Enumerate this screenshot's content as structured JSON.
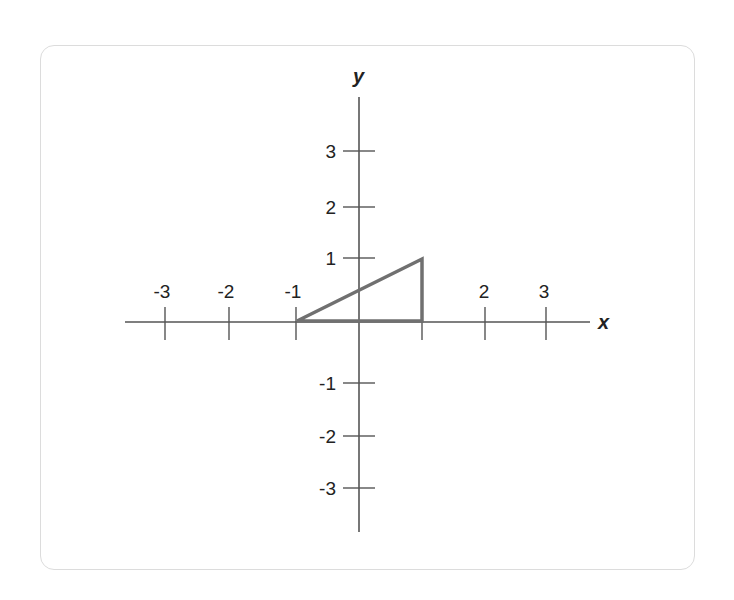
{
  "diagram": {
    "type": "coordinate-plane",
    "axes": {
      "x_label": "x",
      "y_label": "y",
      "x_ticks": [
        "-3",
        "-2",
        "-1",
        "2",
        "3"
      ],
      "y_ticks": [
        "3",
        "2",
        "1",
        "-1",
        "-2",
        "-3"
      ]
    },
    "shape": {
      "type": "triangle",
      "vertices": [
        [
          -1,
          0
        ],
        [
          1,
          0
        ],
        [
          1,
          1
        ]
      ],
      "stroke_color": "#707070"
    },
    "colors": {
      "axis": "#555555",
      "text": "#222222",
      "card_border": "#dcdcdc"
    }
  }
}
